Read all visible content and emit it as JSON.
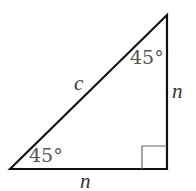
{
  "diagram": {
    "type": "right-triangle",
    "labels": {
      "hypotenuse": "c",
      "bottom_leg": "n",
      "right_leg": "n",
      "bottom_left_angle": "45°",
      "top_right_angle": "45°"
    },
    "right_angle_marker": true,
    "colors": {
      "stroke": "#111111",
      "angle_text": "#555555",
      "marker": "#666666"
    }
  }
}
